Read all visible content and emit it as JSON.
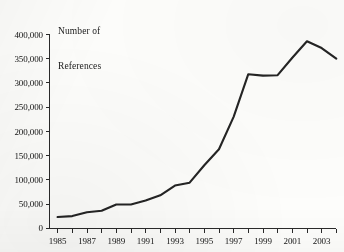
{
  "chart_data": {
    "type": "line",
    "title": "",
    "ylabel_lines": [
      "Number of",
      "References"
    ],
    "xlabel": "",
    "ylabel": "Number of References",
    "x": [
      1985,
      1986,
      1987,
      1988,
      1989,
      1990,
      1991,
      1992,
      1993,
      1994,
      1995,
      1996,
      1997,
      1998,
      1999,
      2000,
      2001,
      2002,
      2003,
      2004
    ],
    "categories": [
      "1985",
      "1986",
      "1987",
      "1988",
      "1989",
      "1990",
      "1991",
      "1992",
      "1993",
      "1994",
      "1995",
      "1996",
      "1997",
      "1998",
      "1999",
      "2000",
      "2001",
      "2002",
      "2003",
      "2004"
    ],
    "values": [
      23000,
      25000,
      33000,
      36000,
      49000,
      49000,
      57000,
      68000,
      88000,
      94000,
      130000,
      163000,
      230000,
      318000,
      315000,
      316000,
      352000,
      386000,
      372000,
      350000
    ],
    "series": [
      {
        "name": "Number of References",
        "values": [
          23000,
          25000,
          33000,
          36000,
          49000,
          49000,
          57000,
          68000,
          88000,
          94000,
          130000,
          163000,
          230000,
          318000,
          315000,
          316000,
          352000,
          386000,
          372000,
          350000
        ]
      }
    ],
    "ylim": [
      0,
      400000
    ],
    "xlim": [
      1985,
      2004
    ],
    "yticks": [
      0,
      50000,
      100000,
      150000,
      200000,
      250000,
      300000,
      350000,
      400000
    ],
    "ytick_labels": [
      "0",
      "50,000",
      "100,000",
      "150,000",
      "200,000",
      "250,000",
      "300,000",
      "350,000",
      "400,000"
    ],
    "xticks": [
      1985,
      1986,
      1987,
      1988,
      1989,
      1990,
      1991,
      1992,
      1993,
      1994,
      1995,
      1996,
      1997,
      1998,
      1999,
      2000,
      2001,
      2002,
      2003,
      2004
    ],
    "xtick_labels_shown": [
      "1985",
      "1987",
      "1989",
      "1991",
      "1993",
      "1995",
      "1997",
      "1999",
      "2001",
      "2003"
    ],
    "grid": false,
    "legend": false,
    "legend_position": "none",
    "line_color": "#242424",
    "annotations": []
  }
}
